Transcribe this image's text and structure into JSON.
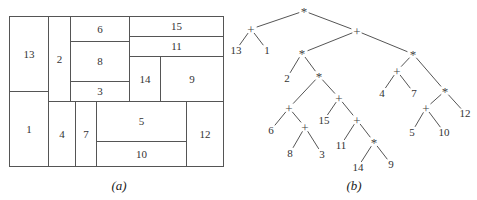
{
  "figure_a": {
    "caption": "(a)",
    "outer": {
      "x": 9,
      "y": 16,
      "w": 214,
      "h": 150
    },
    "rects": [
      {
        "label": "13",
        "x": 9,
        "y": 16,
        "w": 39,
        "h": 75
      },
      {
        "label": "1",
        "x": 9,
        "y": 91,
        "w": 39,
        "h": 75
      },
      {
        "label": "2",
        "x": 48,
        "y": 16,
        "w": 22,
        "h": 85
      },
      {
        "label": "6",
        "x": 70,
        "y": 16,
        "w": 59,
        "h": 25
      },
      {
        "label": "8",
        "x": 70,
        "y": 41,
        "w": 59,
        "h": 40
      },
      {
        "label": "3",
        "x": 70,
        "y": 81,
        "w": 59,
        "h": 20
      },
      {
        "label": "15",
        "x": 129,
        "y": 16,
        "w": 94,
        "h": 20
      },
      {
        "label": "11",
        "x": 129,
        "y": 36,
        "w": 94,
        "h": 20
      },
      {
        "label": "14",
        "x": 129,
        "y": 56,
        "w": 31,
        "h": 45
      },
      {
        "label": "9",
        "x": 160,
        "y": 56,
        "w": 63,
        "h": 45
      },
      {
        "label": "4",
        "x": 48,
        "y": 101,
        "w": 27,
        "h": 65
      },
      {
        "label": "7",
        "x": 75,
        "y": 101,
        "w": 21,
        "h": 65
      },
      {
        "label": "5",
        "x": 96,
        "y": 101,
        "w": 90,
        "h": 40
      },
      {
        "label": "10",
        "x": 96,
        "y": 141,
        "w": 90,
        "h": 25
      },
      {
        "label": "12",
        "x": 186,
        "y": 101,
        "w": 37,
        "h": 65
      }
    ]
  },
  "figure_b": {
    "caption": "(b)",
    "nodes": [
      {
        "id": "n0",
        "label": "*",
        "x": 304,
        "y": 11,
        "type": "op"
      },
      {
        "id": "n1",
        "label": "+",
        "x": 251,
        "y": 29,
        "type": "op"
      },
      {
        "id": "n2",
        "label": "13",
        "x": 236,
        "y": 50,
        "type": "leaf"
      },
      {
        "id": "n3",
        "label": "1",
        "x": 267,
        "y": 50,
        "type": "leaf"
      },
      {
        "id": "n4",
        "label": "+",
        "x": 357,
        "y": 31,
        "type": "op"
      },
      {
        "id": "n5",
        "label": "*",
        "x": 302,
        "y": 53,
        "type": "op"
      },
      {
        "id": "n6",
        "label": "2",
        "x": 287,
        "y": 78,
        "type": "leaf"
      },
      {
        "id": "n7",
        "label": "*",
        "x": 319,
        "y": 76,
        "type": "op"
      },
      {
        "id": "n8",
        "label": "+",
        "x": 289,
        "y": 108,
        "type": "op"
      },
      {
        "id": "n9",
        "label": "6",
        "x": 271,
        "y": 130,
        "type": "leaf"
      },
      {
        "id": "n10",
        "label": "+",
        "x": 305,
        "y": 127,
        "type": "op"
      },
      {
        "id": "n11",
        "label": "8",
        "x": 290,
        "y": 153,
        "type": "leaf"
      },
      {
        "id": "n12",
        "label": "3",
        "x": 322,
        "y": 154,
        "type": "leaf"
      },
      {
        "id": "n13",
        "label": "+",
        "x": 339,
        "y": 98,
        "type": "op"
      },
      {
        "id": "n14",
        "label": "15",
        "x": 324,
        "y": 120,
        "type": "leaf"
      },
      {
        "id": "n15",
        "label": "+",
        "x": 357,
        "y": 120,
        "type": "op"
      },
      {
        "id": "n16",
        "label": "11",
        "x": 341,
        "y": 145,
        "type": "leaf"
      },
      {
        "id": "n17",
        "label": "*",
        "x": 374,
        "y": 142,
        "type": "op"
      },
      {
        "id": "n18",
        "label": "14",
        "x": 358,
        "y": 167,
        "type": "leaf"
      },
      {
        "id": "n19",
        "label": "9",
        "x": 391,
        "y": 164,
        "type": "leaf"
      },
      {
        "id": "n20",
        "label": "*",
        "x": 413,
        "y": 54,
        "type": "op"
      },
      {
        "id": "n21",
        "label": "+",
        "x": 397,
        "y": 71,
        "type": "op"
      },
      {
        "id": "n22",
        "label": "4",
        "x": 382,
        "y": 93,
        "type": "leaf"
      },
      {
        "id": "n23",
        "label": "7",
        "x": 414,
        "y": 93,
        "type": "leaf"
      },
      {
        "id": "n24",
        "label": "*",
        "x": 445,
        "y": 91,
        "type": "op"
      },
      {
        "id": "n25",
        "label": "+",
        "x": 426,
        "y": 108,
        "type": "op"
      },
      {
        "id": "n26",
        "label": "5",
        "x": 412,
        "y": 132,
        "type": "leaf"
      },
      {
        "id": "n27",
        "label": "10",
        "x": 444,
        "y": 132,
        "type": "leaf"
      },
      {
        "id": "n28",
        "label": "12",
        "x": 465,
        "y": 113,
        "type": "leaf"
      }
    ],
    "edges": [
      [
        "n0",
        "n1"
      ],
      [
        "n0",
        "n4"
      ],
      [
        "n1",
        "n2"
      ],
      [
        "n1",
        "n3"
      ],
      [
        "n4",
        "n5"
      ],
      [
        "n4",
        "n20"
      ],
      [
        "n5",
        "n6"
      ],
      [
        "n5",
        "n7"
      ],
      [
        "n7",
        "n8"
      ],
      [
        "n7",
        "n13"
      ],
      [
        "n8",
        "n9"
      ],
      [
        "n8",
        "n10"
      ],
      [
        "n10",
        "n11"
      ],
      [
        "n10",
        "n12"
      ],
      [
        "n13",
        "n14"
      ],
      [
        "n13",
        "n15"
      ],
      [
        "n15",
        "n16"
      ],
      [
        "n15",
        "n17"
      ],
      [
        "n17",
        "n18"
      ],
      [
        "n17",
        "n19"
      ],
      [
        "n20",
        "n21"
      ],
      [
        "n20",
        "n24"
      ],
      [
        "n21",
        "n22"
      ],
      [
        "n21",
        "n23"
      ],
      [
        "n24",
        "n25"
      ],
      [
        "n24",
        "n28"
      ],
      [
        "n25",
        "n26"
      ],
      [
        "n25",
        "n27"
      ]
    ]
  }
}
